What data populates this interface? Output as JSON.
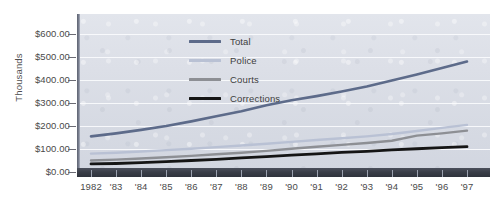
{
  "chart_data": {
    "type": "line",
    "title": "",
    "xlabel": "",
    "ylabel": "Thousands",
    "ylim": [
      0,
      600
    ],
    "ytick_values": [
      600,
      500,
      400,
      300,
      200,
      100,
      0
    ],
    "ytick_labels": [
      "$600.00",
      "$500.00",
      "$400.00",
      "$300.00",
      "$200.00",
      "$100.00",
      "$0.00"
    ],
    "grid": true,
    "legend_position": "top-left inside plot",
    "x": [
      1982,
      1983,
      1984,
      1985,
      1986,
      1987,
      1988,
      1989,
      1990,
      1991,
      1992,
      1993,
      1994,
      1995,
      1996,
      1997
    ],
    "xtick_labels": [
      "1982",
      "'83",
      "'84",
      "'85",
      "'86",
      "'87",
      "'88",
      "'89",
      "'90",
      "'91",
      "'92",
      "'93",
      "'94",
      "'95",
      "'96",
      "'97"
    ],
    "series": [
      {
        "name": "Total",
        "color": "#5d6b8a",
        "values": [
          155,
          168,
          183,
          200,
          220,
          242,
          264,
          290,
          312,
          330,
          350,
          372,
          398,
          424,
          452,
          480
        ]
      },
      {
        "name": "Police",
        "color": "#b9c1d4",
        "values": [
          80,
          84,
          89,
          95,
          101,
          108,
          115,
          123,
          131,
          139,
          147,
          155,
          165,
          178,
          192,
          205
        ]
      },
      {
        "name": "Courts",
        "color": "#8d8f94",
        "values": [
          50,
          54,
          59,
          64,
          70,
          77,
          84,
          92,
          101,
          110,
          118,
          126,
          136,
          158,
          168,
          180
        ]
      },
      {
        "name": "Corrections",
        "color": "#151515",
        "values": [
          35,
          37,
          41,
          45,
          50,
          55,
          61,
          67,
          73,
          79,
          85,
          90,
          96,
          101,
          106,
          110
        ]
      }
    ]
  },
  "legend": {
    "items": [
      {
        "label": "Total",
        "color": "#5d6b8a"
      },
      {
        "label": "Police",
        "color": "#b9c1d4"
      },
      {
        "label": "Courts",
        "color": "#8d8f94"
      },
      {
        "label": "Corrections",
        "color": "#151515"
      }
    ]
  }
}
